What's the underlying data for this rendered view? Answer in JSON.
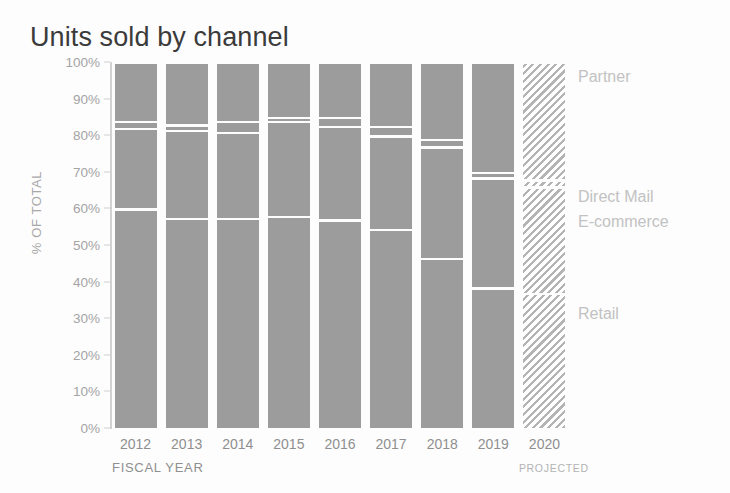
{
  "chart_data": {
    "type": "bar",
    "subtype": "stacked-percentage",
    "title": "Units sold by channel",
    "xlabel": "FISCAL YEAR",
    "ylabel": "% OF TOTAL",
    "ylim": [
      0,
      100
    ],
    "ytick_labels": [
      "100%",
      "90%",
      "80%",
      "70%",
      "60%",
      "50%",
      "40%",
      "30%",
      "20%",
      "10%",
      "0%"
    ],
    "ytick_values": [
      100,
      90,
      80,
      70,
      60,
      50,
      40,
      30,
      20,
      10,
      0
    ],
    "grid": false,
    "legend_position": "right-inline",
    "categories": [
      "2012",
      "2013",
      "2014",
      "2015",
      "2016",
      "2017",
      "2018",
      "2019",
      "2020"
    ],
    "series": [
      {
        "name": "Retail",
        "values": [
          60.0,
          57.5,
          57.5,
          58.0,
          57.0,
          54.5,
          46.5,
          38.5,
          37.0
        ]
      },
      {
        "name": "E-commerce",
        "values": [
          22.0,
          24.0,
          23.5,
          26.0,
          25.5,
          25.5,
          30.5,
          30.0,
          29.0
        ]
      },
      {
        "name": "Direct Mail",
        "values": [
          2.0,
          1.5,
          3.0,
          1.0,
          2.5,
          2.5,
          2.0,
          1.5,
          2.0
        ]
      },
      {
        "name": "Partner",
        "values": [
          16.0,
          17.0,
          16.0,
          15.0,
          15.0,
          17.5,
          21.0,
          30.0,
          32.0
        ]
      }
    ],
    "annotations": [
      "PROJECTED"
    ],
    "projected_category": "2020",
    "colors": {
      "bar_fill": "#9c9c9c",
      "projected_hatch": "#b4b4b4",
      "divider": "#ffffff",
      "axis": "#d2d2d2",
      "tick_text": "#a4a4a4",
      "title_text": "#3b3b3b",
      "legend_text": "#c2c2c2",
      "background": "#fdfdfd"
    }
  },
  "legend": {
    "items": [
      {
        "label": "Partner"
      },
      {
        "label": "Direct Mail"
      },
      {
        "label": "E-commerce"
      },
      {
        "label": "Retail"
      }
    ]
  },
  "axis": {
    "x_title": "FISCAL YEAR",
    "y_title": "% OF TOTAL",
    "projected_note": "PROJECTED"
  }
}
